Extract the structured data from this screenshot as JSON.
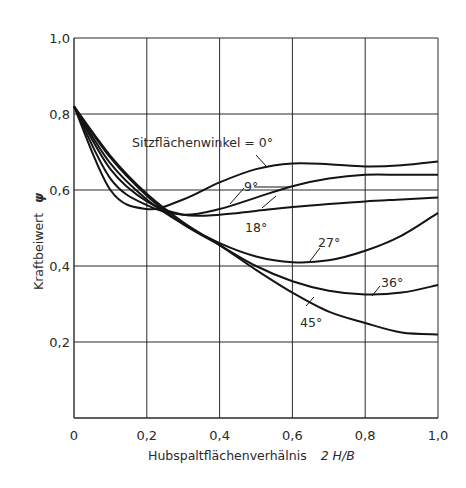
{
  "chart_data": {
    "type": "line",
    "title": "",
    "xlabel": "Hubspaltflächenverhälnis  2 H/B",
    "ylabel": "Kraftbeiwert ψ",
    "xlim": [
      0,
      1.0
    ],
    "ylim": [
      0,
      1.0
    ],
    "grid": true,
    "x_ticks": [
      "0",
      "0,2",
      "0,4",
      "0,6",
      "0,8",
      "1,0"
    ],
    "y_ticks": [
      "0,2",
      "0,4",
      "0,6",
      "0,8",
      "1,0"
    ],
    "legend_title": "Sitzflächenwinkel = 0°",
    "x": [
      0,
      0.1,
      0.2,
      0.3,
      0.4,
      0.5,
      0.6,
      0.7,
      0.8,
      0.9,
      1.0
    ],
    "series": [
      {
        "name": "0°",
        "values": [
          0.82,
          0.6,
          0.55,
          0.575,
          0.62,
          0.655,
          0.67,
          0.668,
          0.662,
          0.665,
          0.675
        ]
      },
      {
        "name": "9°",
        "values": [
          0.82,
          0.63,
          0.56,
          0.535,
          0.55,
          0.58,
          0.61,
          0.63,
          0.64,
          0.64,
          0.64
        ]
      },
      {
        "name": "18°",
        "values": [
          0.82,
          0.655,
          0.57,
          0.535,
          0.535,
          0.545,
          0.555,
          0.563,
          0.57,
          0.575,
          0.58
        ]
      },
      {
        "name": "27°",
        "values": [
          0.82,
          0.67,
          0.575,
          0.51,
          0.46,
          0.425,
          0.41,
          0.415,
          0.44,
          0.48,
          0.54
        ]
      },
      {
        "name": "36°",
        "values": [
          0.82,
          0.685,
          0.585,
          0.51,
          0.455,
          0.4,
          0.36,
          0.335,
          0.325,
          0.33,
          0.35
        ]
      },
      {
        "name": "45°",
        "values": [
          0.82,
          0.69,
          0.59,
          0.515,
          0.455,
          0.39,
          0.33,
          0.28,
          0.25,
          0.225,
          0.22
        ]
      }
    ],
    "annotations": [
      {
        "text": "Sitzflächenwinkel = 0°",
        "target": "0°"
      },
      {
        "text": "9°",
        "target": "9°"
      },
      {
        "text": "18°",
        "target": "18°"
      },
      {
        "text": "27°",
        "target": "27°"
      },
      {
        "text": "36°",
        "target": "36°"
      },
      {
        "text": "45°",
        "target": "45°"
      }
    ]
  },
  "labels": {
    "xlabel_main": "Hubspaltflächenverhälnis",
    "xlabel_expr": "2 H/B",
    "ylabel_main": "Kraftbeiwert",
    "ylabel_sym": "ψ",
    "ann_0": "Sitzflächenwinkel = 0°",
    "ann_9": "9°",
    "ann_18": "18°",
    "ann_27": "27°",
    "ann_36": "36°",
    "ann_45": "45°"
  },
  "colors": {
    "line": "#141414",
    "grid": "#2a2a2a",
    "background": "#ffffff"
  }
}
